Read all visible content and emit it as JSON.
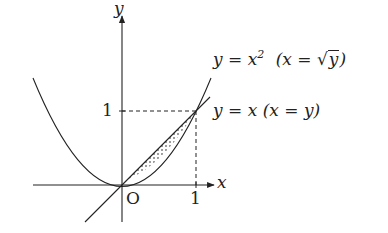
{
  "diagram": {
    "axis_labels": {
      "x": "x",
      "y": "y"
    },
    "origin_label": "O",
    "ticks": {
      "x_one": "1",
      "y_one": "1"
    },
    "curves": [
      {
        "id": "parabola",
        "equation": "y = x^2",
        "inverse": "x = √y",
        "label_main": "y = x",
        "label_exp": "2",
        "label_paren_open": "(x = ",
        "label_sqrt_arg": "y",
        "label_paren_close": ")"
      },
      {
        "id": "line",
        "equation": "y = x",
        "inverse": "x = y",
        "label": "y = x  (x = y)"
      }
    ],
    "shaded_region": {
      "between": [
        "y = x",
        "y = x^2"
      ],
      "x_range": [
        0,
        1
      ],
      "fill": "dotted"
    },
    "guides": {
      "dashed_to": [
        1,
        1
      ]
    },
    "colors": {
      "stroke": "#222222",
      "background": "#ffffff"
    }
  }
}
